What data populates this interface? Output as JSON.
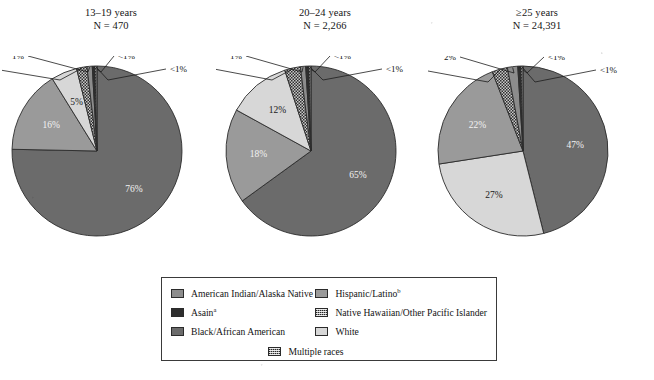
{
  "figure": {
    "type": "pie-chart-panel",
    "background": "#ffffff"
  },
  "palette": {
    "american_indian": "#8c8c8c",
    "asian": "#2e2e2e",
    "black_african_american": "#6b6b6b",
    "hispanic_latino": "#9a9a9a",
    "native_hawaiian": "#6d6d6d",
    "white": "#d7d7d7",
    "multiple_races": "#7a7a7a",
    "outline": "#2b2b2b"
  },
  "legend": {
    "items": [
      {
        "label": "American Indian/Alaska Native",
        "sup": "",
        "key": "american_indian",
        "pattern": "solid"
      },
      {
        "label": "Asain",
        "sup": "a",
        "key": "asian",
        "pattern": "solid"
      },
      {
        "label": "Black/African American",
        "sup": "",
        "key": "black_african_american",
        "pattern": "solid"
      },
      {
        "label": "Hispanic/Latino",
        "sup": "b",
        "key": "hispanic_latino",
        "pattern": "solid"
      },
      {
        "label": "Native Hawaiian/Other Pacific Islander",
        "sup": "",
        "key": "native_hawaiian",
        "pattern": "checker"
      },
      {
        "label": "White",
        "sup": "",
        "key": "white",
        "pattern": "solid"
      },
      {
        "label": "Multiple races",
        "sup": "",
        "key": "multiple_races",
        "pattern": "checker"
      }
    ],
    "column_left": [
      0,
      1,
      2
    ],
    "column_right": [
      3,
      4,
      5
    ],
    "centered": [
      6
    ]
  },
  "chart_data": [
    {
      "type": "pie",
      "title": "13–19 years",
      "n_label": "N = 470",
      "n_value": 470,
      "categories": [
        "Black/African American",
        "Hispanic/Latino",
        "White",
        "Multiple races",
        "American Indian/Alaska Native",
        "Asain",
        "Native Hawaiian/Other Pacific Islander"
      ],
      "values": [
        76,
        16,
        5,
        2,
        1,
        0.5,
        0.4
      ],
      "labels": [
        "76%",
        "16%",
        "5%",
        "2%",
        "1%",
        "<1%",
        "<1%"
      ],
      "label_placement": [
        "inside",
        "inside",
        "inside",
        "callout",
        "callout",
        "callout",
        "callout"
      ]
    },
    {
      "type": "pie",
      "title": "20–24 years",
      "n_label": "N = 2,266",
      "n_value": 2266,
      "categories": [
        "Black/African American",
        "Hispanic/Latino",
        "White",
        "Multiple races",
        "American Indian/Alaska Native",
        "Asain",
        "Native Hawaiian/Other Pacific Islander"
      ],
      "values": [
        65,
        18,
        12,
        3,
        1,
        0.6,
        0.4
      ],
      "labels": [
        "65%",
        "18%",
        "12%",
        "3%",
        "1%",
        "<1%",
        "<1%"
      ],
      "label_placement": [
        "inside",
        "inside",
        "inside",
        "callout",
        "callout",
        "callout",
        "callout"
      ]
    },
    {
      "type": "pie",
      "title": "≥25 years",
      "n_label": "N = 24,391",
      "n_value": 24391,
      "categories": [
        "Black/African American",
        "White",
        "Hispanic/Latino",
        "Multiple races",
        "American Indian/Alaska Native",
        "Asain",
        "Native Hawaiian/Other Pacific Islander"
      ],
      "values": [
        47,
        27,
        22,
        3,
        2,
        0.6,
        0.4
      ],
      "labels": [
        "47%",
        "27%",
        "22%",
        "3%",
        "2%",
        "<1%",
        "<1%"
      ],
      "label_placement": [
        "inside",
        "inside",
        "inside",
        "callout",
        "callout",
        "callout",
        "callout"
      ]
    }
  ]
}
